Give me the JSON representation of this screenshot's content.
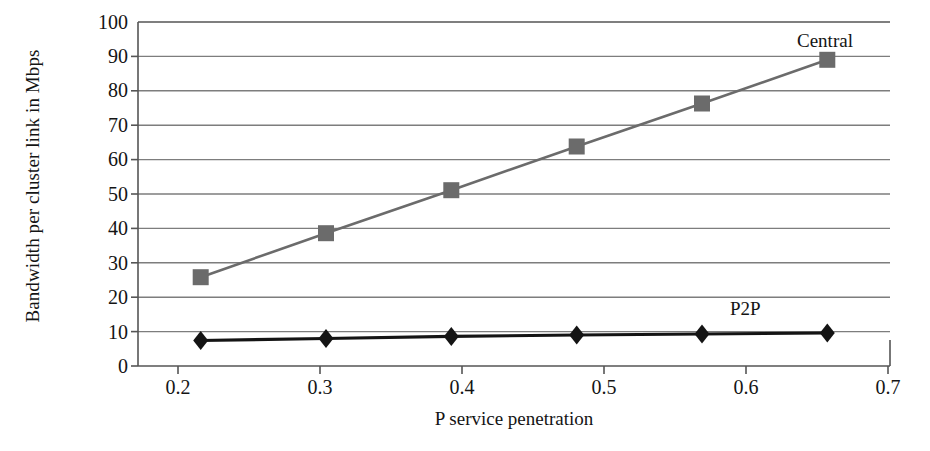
{
  "chart_data": {
    "type": "line",
    "title": "",
    "subtitle": "",
    "xlabel": "P service penetration",
    "ylabel": "Bandwidth per cluster link in Mbps",
    "x": [
      0.2,
      0.3,
      0.4,
      0.5,
      0.6,
      0.7
    ],
    "xtick_labels": [
      "0.2",
      "0.3",
      "0.4",
      "0.5",
      "0.6",
      "0.7"
    ],
    "ytick_labels": [
      "0",
      "10",
      "20",
      "30",
      "40",
      "50",
      "60",
      "70",
      "80",
      "90",
      "100"
    ],
    "yticks": [
      0,
      10,
      20,
      30,
      40,
      50,
      60,
      70,
      80,
      90,
      100
    ],
    "xlim": [
      0.15,
      0.75
    ],
    "ylim": [
      0,
      100
    ],
    "grid": "horizontal",
    "legend_position": "inline-annotations",
    "series": [
      {
        "name": "Central",
        "label": "Central",
        "marker": "square",
        "color": "#6b6b6b",
        "line_color": "#6b6b6b",
        "values": [
          25.8,
          38.6,
          51.1,
          63.8,
          76.3,
          89.0
        ]
      },
      {
        "name": "P2P",
        "label": "P2P",
        "marker": "diamond",
        "color": "#141414",
        "line_color": "#141414",
        "values": [
          7.4,
          8.0,
          8.6,
          9.0,
          9.3,
          9.6
        ]
      }
    ],
    "annotations": [
      {
        "text": "Central",
        "series": "Central"
      },
      {
        "text": "P2P",
        "series": "P2P"
      }
    ]
  },
  "figure": {
    "background_color": "#ffffff",
    "axis_color": "#4a4a4a",
    "grid_color": "#7a7a7a",
    "text_color": "#141414"
  }
}
